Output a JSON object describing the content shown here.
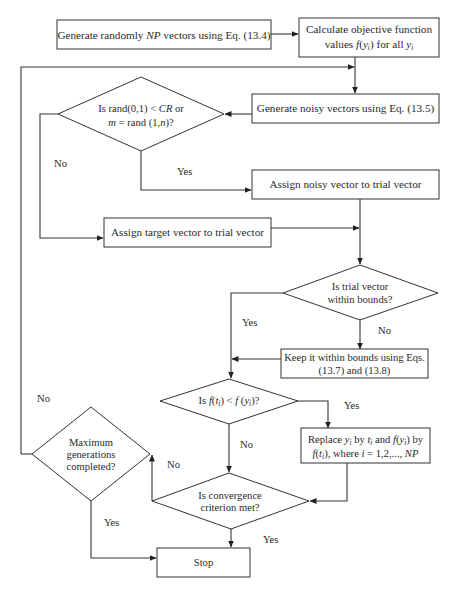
{
  "diagram": {
    "type": "flowchart",
    "nodes": {
      "init": {
        "type": "process",
        "parts": [
          "Generate randomly ",
          "NP",
          " vectors using Eq. (13.4)"
        ]
      },
      "evaluate": {
        "type": "process",
        "line1": "Calculate objective function",
        "line2_parts": [
          "values ",
          "f",
          "(",
          "y",
          "i",
          ") for all ",
          "y",
          "i"
        ]
      },
      "noisy": {
        "type": "process",
        "text": "Generate noisy vectors using Eq. (13.5)"
      },
      "crossover_check": {
        "type": "decision",
        "line1_parts": [
          "Is rand(0,1) < ",
          "CR",
          " or"
        ],
        "line2_parts": [
          "m",
          " = rand (1,",
          "n",
          ")?"
        ]
      },
      "assign_noisy": {
        "type": "process",
        "text": "Assign noisy vector to trial vector"
      },
      "assign_target": {
        "type": "process",
        "text": "Assign target vector to trial vector"
      },
      "bounds_check": {
        "type": "decision",
        "line1": "Is trial vector",
        "line2": "within bounds?"
      },
      "keep_bounds": {
        "type": "process",
        "line1": "Keep it within bounds using Eqs.",
        "line2": "(13.7) and (13.8)"
      },
      "selection_check": {
        "type": "decision",
        "parts": [
          "Is ",
          "f",
          "(",
          "t",
          "i",
          ") < ",
          "f",
          " (",
          "y",
          "i",
          ")?"
        ]
      },
      "replace": {
        "type": "process",
        "line1_parts": [
          "Replace ",
          "y",
          "i",
          " by ",
          "t",
          "i",
          " and ",
          "f",
          "(",
          "y",
          "i",
          ") by"
        ],
        "line2_parts": [
          "f",
          "(",
          "t",
          "i",
          "), where ",
          "i",
          " = 1,2,..., ",
          "NP"
        ]
      },
      "convergence_check": {
        "type": "decision",
        "line1": "Is convergence",
        "line2": "criterion met?"
      },
      "max_gen_check": {
        "type": "decision",
        "line1": "Maximum",
        "line2": "generations",
        "line3": "completed?"
      },
      "stop": {
        "type": "terminal",
        "text": "Stop"
      }
    },
    "edge_labels": {
      "crossover_no": "No",
      "crossover_yes": "Yes",
      "bounds_yes": "Yes",
      "bounds_no": "No",
      "selection_yes": "Yes",
      "selection_no": "No",
      "convergence_no": "No",
      "convergence_yes": "Yes",
      "maxgen_no": "No",
      "maxgen_yes": "Yes"
    },
    "edges": [
      {
        "from": "init",
        "to": "evaluate"
      },
      {
        "from": "evaluate",
        "to": "noisy"
      },
      {
        "from": "noisy",
        "to": "crossover_check"
      },
      {
        "from": "crossover_check",
        "to": "assign_noisy",
        "label": "Yes"
      },
      {
        "from": "crossover_check",
        "to": "assign_target",
        "label": "No"
      },
      {
        "from": "assign_noisy",
        "to": "bounds_check"
      },
      {
        "from": "assign_target",
        "to": "bounds_check"
      },
      {
        "from": "bounds_check",
        "to": "keep_bounds",
        "label": "No"
      },
      {
        "from": "bounds_check",
        "to": "selection_check",
        "label": "Yes"
      },
      {
        "from": "keep_bounds",
        "to": "selection_check"
      },
      {
        "from": "selection_check",
        "to": "replace",
        "label": "Yes"
      },
      {
        "from": "selection_check",
        "to": "convergence_check",
        "label": "No"
      },
      {
        "from": "replace",
        "to": "convergence_check"
      },
      {
        "from": "convergence_check",
        "to": "stop",
        "label": "Yes"
      },
      {
        "from": "convergence_check",
        "to": "max_gen_check",
        "label": "No"
      },
      {
        "from": "max_gen_check",
        "to": "stop",
        "label": "Yes"
      },
      {
        "from": "max_gen_check",
        "to": "noisy",
        "label": "No"
      }
    ]
  }
}
